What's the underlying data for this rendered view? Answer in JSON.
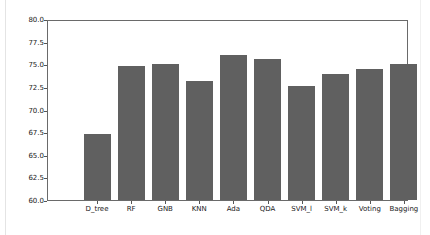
{
  "chart_data": {
    "type": "bar",
    "title": "",
    "xlabel": "",
    "ylabel": "",
    "categories": [
      "D_tree",
      "RF",
      "GNB",
      "KNN",
      "Ada",
      "QDA",
      "SVM_l",
      "SVM_k",
      "Voting",
      "Bagging"
    ],
    "values": [
      67.3,
      74.8,
      75.0,
      73.1,
      76.0,
      75.6,
      72.6,
      73.9,
      74.5,
      75.0
    ],
    "ylim": [
      60.0,
      80.0
    ],
    "yticks": [
      "60.0",
      "62.5",
      "65.0",
      "67.5",
      "70.0",
      "72.5",
      "75.0",
      "77.5",
      "80.0"
    ],
    "grid": false,
    "legend": null,
    "bar_color": "#606060"
  }
}
